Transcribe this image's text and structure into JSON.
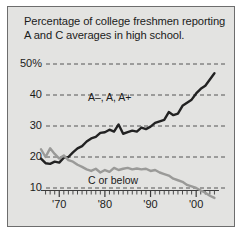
{
  "title": "Percentage of college freshmen reporting A and C averages in high school.",
  "colors": {
    "background": "#e3e3e1",
    "border": "#6d6d6d",
    "grid": "#555555",
    "series_a": "#222222",
    "series_c": "#9a9a98",
    "text": "#1b1b1b"
  },
  "axis": {
    "y_ticks": [
      {
        "value": 50,
        "label": "50%"
      },
      {
        "value": 40,
        "label": "40"
      },
      {
        "value": 30,
        "label": "30"
      },
      {
        "value": 20,
        "label": "20"
      },
      {
        "value": 10,
        "label": "10"
      }
    ],
    "x_ticks": [
      {
        "value": 1970,
        "label": "'70"
      },
      {
        "value": 1980,
        "label": "'80"
      },
      {
        "value": 1990,
        "label": "'90"
      },
      {
        "value": 2000,
        "label": "'00"
      }
    ]
  },
  "labels": {
    "series_a": "A–, A, A+",
    "series_c": "C or below"
  },
  "chart_data": {
    "type": "line",
    "title": "Percentage of college freshmen reporting A and C averages in high school.",
    "xlabel": "",
    "ylabel": "",
    "xlim": [
      1966,
      2005
    ],
    "ylim": [
      4,
      53
    ],
    "grid": true,
    "legend_position": "inline-annotation",
    "x": [
      1966,
      1967,
      1968,
      1969,
      1970,
      1971,
      1972,
      1973,
      1974,
      1975,
      1976,
      1977,
      1978,
      1979,
      1980,
      1981,
      1982,
      1983,
      1984,
      1985,
      1986,
      1987,
      1988,
      1989,
      1990,
      1991,
      1992,
      1993,
      1994,
      1995,
      1996,
      1997,
      1998,
      1999,
      2000,
      2001,
      2002,
      2003,
      2004
    ],
    "series": [
      {
        "name": "A–, A, A+",
        "color": "#222222",
        "values": [
          19.5,
          18.0,
          17.8,
          18.5,
          18.2,
          19.8,
          20.0,
          21.5,
          22.8,
          23.5,
          25.0,
          26.0,
          26.5,
          27.8,
          28.0,
          28.8,
          28.2,
          30.5,
          27.5,
          28.0,
          28.5,
          28.2,
          29.5,
          29.0,
          29.8,
          31.0,
          31.5,
          32.0,
          34.5,
          33.5,
          34.0,
          36.5,
          37.5,
          38.5,
          40.5,
          42.0,
          43.0,
          45.0,
          47.0
        ]
      },
      {
        "name": "C or below",
        "color": "#9a9a98",
        "values": [
          22.5,
          20.0,
          22.8,
          21.0,
          19.5,
          20.5,
          19.0,
          18.5,
          17.5,
          16.8,
          16.0,
          15.5,
          16.2,
          15.0,
          15.8,
          15.2,
          16.5,
          15.8,
          16.2,
          16.5,
          16.0,
          16.3,
          16.0,
          16.2,
          15.5,
          15.8,
          15.0,
          14.5,
          14.0,
          13.0,
          12.5,
          12.0,
          11.0,
          10.5,
          10.0,
          9.2,
          8.5,
          7.5,
          6.8
        ]
      }
    ]
  }
}
